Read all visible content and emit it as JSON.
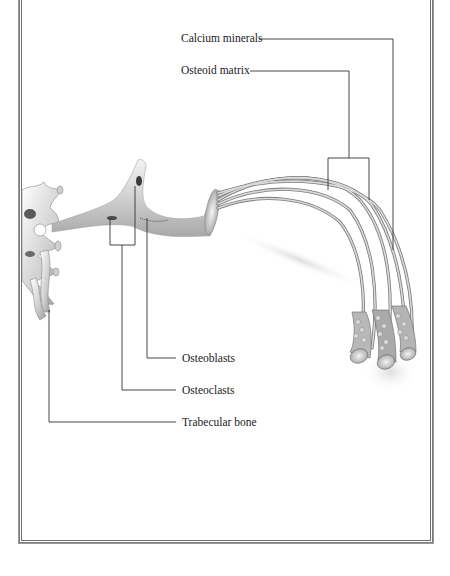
{
  "figure": {
    "type": "anatomical-illustration"
  },
  "labels": {
    "calcium_minerals": "Calcium minerals",
    "osteoid_matrix": "Osteoid matrix",
    "osteoblasts": "Osteoblasts",
    "osteoclasts": "Osteoclasts",
    "trabecular_bone": "Trabecular bone"
  },
  "colors": {
    "frame": "#6f6f6f",
    "leader_line": "#333333",
    "bone_light": "#e6e6e6",
    "bone_mid": "#b5b5b5",
    "bone_dark": "#6a6a6a",
    "text": "#222222"
  }
}
